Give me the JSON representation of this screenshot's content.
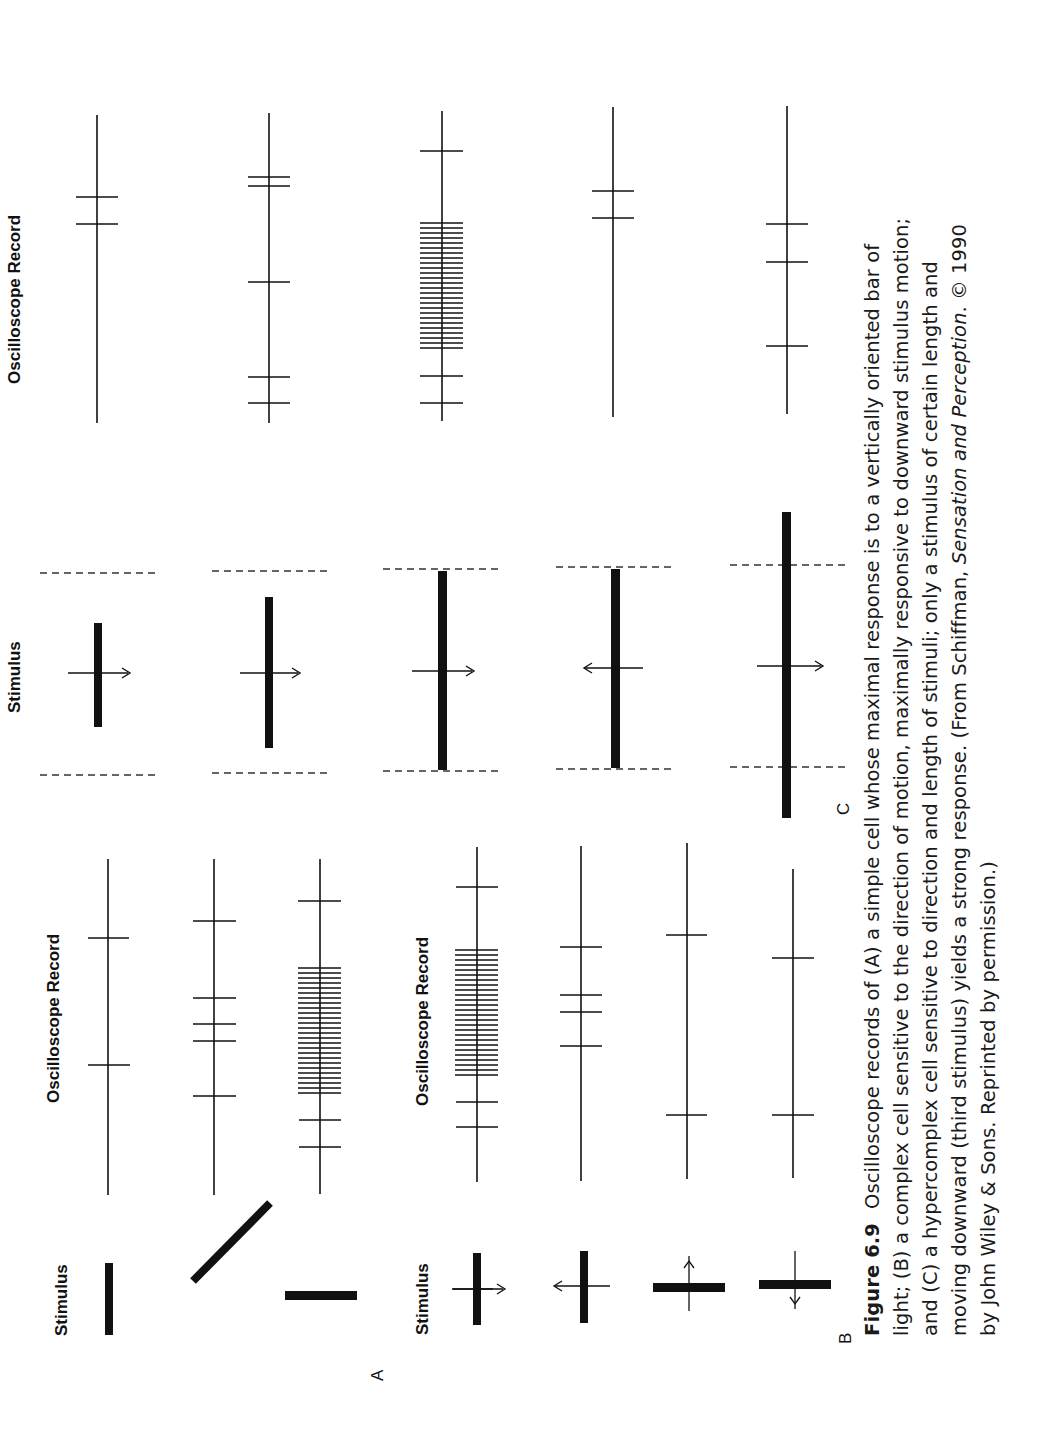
{
  "figure": {
    "number": "Figure 6.9",
    "caption_part1": "Oscilloscope records of (A) a simple cell whose maximal response is to a vertically oriented bar of light; (B) a complex cell sensitive to the direction of motion, maximally responsive to downward stimulus motion; and (C) a hypercomplex cell sensitive to direction and length of stimuli; only a stimulus of certain length and moving downward (third stimulus) yields a strong response. (From Schiffman, ",
    "caption_italic": "Sensation and Perception",
    "caption_part2": ". © 1990 by John Wiley & Sons. Reprinted by permission.)"
  },
  "panels": {
    "A": {
      "letter": "A",
      "stimulus_label": "Stimulus",
      "record_label": "Oscilloscope Record",
      "rows": [
        {
          "stimulus": "vertical bar",
          "spikes": 2
        },
        {
          "stimulus": "oblique bar",
          "spikes": 5
        },
        {
          "stimulus": "horizontal bar",
          "spikes": 29
        }
      ]
    },
    "B": {
      "letter": "B",
      "stimulus_label": "Stimulus",
      "record_label": "Oscilloscope Record",
      "rows": [
        {
          "stimulus": "bar moving right",
          "spikes": 29
        },
        {
          "stimulus": "bar moving left",
          "spikes": 4
        },
        {
          "stimulus": "bar moving up",
          "spikes": 2
        },
        {
          "stimulus": "bar moving down",
          "spikes": 2
        }
      ]
    },
    "C": {
      "letter": "C",
      "stimulus_label": "Stimulus",
      "record_label": "Oscilloscope Record",
      "rows": [
        {
          "stimulus": "short bar moving down",
          "spikes": 2
        },
        {
          "stimulus": "medium bar moving down",
          "spikes": 5
        },
        {
          "stimulus": "bar of field length moving down",
          "spikes": 25
        },
        {
          "stimulus": "bar of field length moving up",
          "spikes": 2
        },
        {
          "stimulus": "bar longer than field moving down",
          "spikes": 3
        }
      ]
    }
  }
}
